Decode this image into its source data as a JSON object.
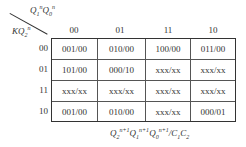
{
  "diagram": {
    "type": "karnaugh-map-state-table",
    "col_variable_label": "Q1nQ0n",
    "row_variable_label": "KQ2n",
    "col_headers": [
      "00",
      "01",
      "11",
      "10"
    ],
    "row_headers": [
      "00",
      "01",
      "11",
      "10"
    ],
    "cells": [
      [
        "001/00",
        "010/00",
        "100/00",
        "011/00"
      ],
      [
        "101/00",
        "000/10",
        "xxx/xx",
        "xxx/xx"
      ],
      [
        "xxx/xx",
        "xxx/xx",
        "xxx/xx",
        "xxx/xx"
      ],
      [
        "001/00",
        "010/00",
        "xxx/xx",
        "000/01"
      ]
    ],
    "caption": "Q2n+1 Q1n+1 Q0n+1 / C1 C2"
  }
}
